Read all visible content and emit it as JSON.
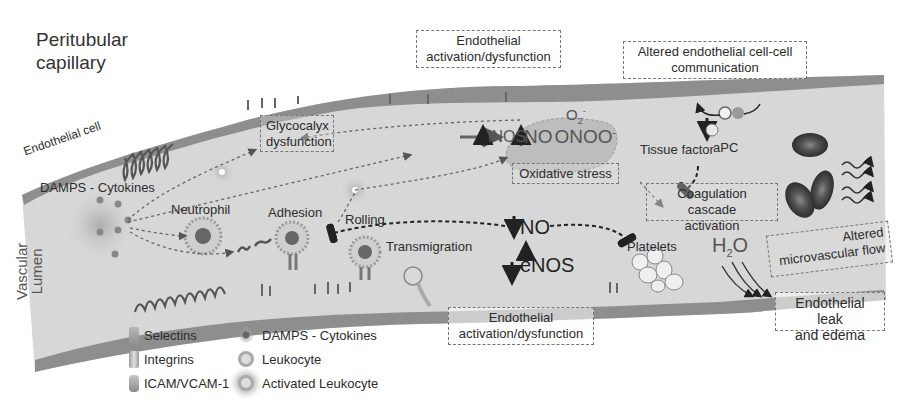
{
  "figure": {
    "title_line1": "Peritubular",
    "title_line2": "capillary",
    "endothelial_cell_label": "Endothelial cell",
    "vascular_lumen_line1": "Vascular",
    "vascular_lumen_line2": "Lumen",
    "colors": {
      "tube_fill": "#d9d9d9",
      "endothelium": "#8a8a8a",
      "text": "#2c2c2c",
      "box_border": "#777777"
    }
  },
  "labels": {
    "damps": "DAMPS - Cytokines",
    "neutrophil": "Neutrophil",
    "adhesion": "Adhesion",
    "rolling": "Rolling",
    "transmigration": "Transmigration",
    "inos": "iNOS",
    "no_top": "NO",
    "onoo": "ONOO",
    "onoo_sup": "-",
    "o2": "O",
    "o2_sub": "2",
    "o2_sup": "-",
    "no_mid": "NO",
    "enos": "eNOS",
    "platelets": "Platelets",
    "tissue_factor": "Tissue factor",
    "apc": "aPC",
    "h2o_h": "H",
    "h2o_sub": "2",
    "h2o_o": "O"
  },
  "boxes": {
    "endothelial_activation_top_l1": "Endothelial",
    "endothelial_activation_top_l2": "activation/dysfunction",
    "altered_comm_l1": "Altered endothelial cell-cell",
    "altered_comm_l2": "communication",
    "glycocalyx_l1": "Glycocalyx",
    "glycocalyx_l2": "dysfunction",
    "oxidative_stress": "Oxidative stress",
    "coagulation_l1": "Coagulation cascade",
    "coagulation_l2": "activation",
    "altered_flow_l1": "Altered",
    "altered_flow_l2": "microvascular flow",
    "endothelial_activation_bottom_l1": "Endothelial",
    "endothelial_activation_bottom_l2": "activation/dysfunction",
    "leak_l1": "Endothelial leak",
    "leak_l2": "and edema"
  },
  "legend": [
    {
      "symbol": "selectin-icon",
      "label": "Selectins"
    },
    {
      "symbol": "integrin-icon",
      "label": "Integrins"
    },
    {
      "symbol": "icam-vcam-icon",
      "label": "ICAM/VCAM-1"
    },
    {
      "symbol": "damps-cytokine-icon",
      "label": "DAMPS - Cytokines"
    },
    {
      "symbol": "leukocyte-icon",
      "label": "Leukocyte"
    },
    {
      "symbol": "activated-leukocyte-icon",
      "label": "Activated Leukocyte"
    }
  ]
}
